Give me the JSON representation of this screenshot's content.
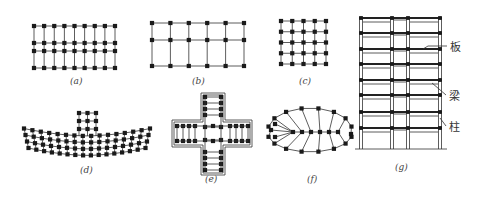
{
  "figure": {
    "panels": [
      {
        "id": "a",
        "caption": "(a)",
        "type": "rectangular-grid",
        "columns": 9,
        "rows": 4
      },
      {
        "id": "b",
        "caption": "(b)",
        "type": "rectangular-grid",
        "columns": 6,
        "rows": 3
      },
      {
        "id": "c",
        "caption": "(c)",
        "type": "square-grid",
        "columns": 5,
        "rows": 5
      },
      {
        "id": "d",
        "caption": "(d)",
        "type": "curved-grid-with-tower",
        "columns": 16,
        "rows": 4,
        "tower_columns": 3,
        "tower_rows": 3
      },
      {
        "id": "e",
        "caption": "(e)",
        "type": "cross-shaped-grid"
      },
      {
        "id": "f",
        "caption": "(f)",
        "type": "oval-radial-grid"
      },
      {
        "id": "g",
        "caption": "(g)",
        "type": "frame-elevation",
        "floors": 8
      }
    ],
    "elevation_labels": {
      "slab": "板",
      "beam": "梁",
      "column": "柱"
    }
  }
}
